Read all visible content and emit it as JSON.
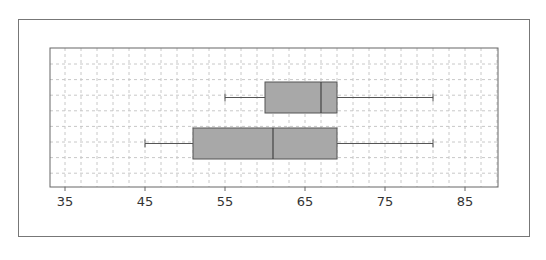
{
  "chart_data": {
    "type": "boxplot",
    "orientation": "horizontal",
    "title": "",
    "xlabel": "",
    "ylabel": "",
    "xlim": [
      34,
      89
    ],
    "x_ticks": [
      35,
      45,
      55,
      65,
      75,
      85
    ],
    "x_tick_labels": [
      "35",
      "45",
      "55",
      "65",
      "75",
      "85"
    ],
    "grid": true,
    "grid_style": "dashed",
    "legend": null,
    "series": [
      {
        "name": "top",
        "min": 55,
        "q1": 60,
        "median": 67,
        "q3": 69,
        "max": 81
      },
      {
        "name": "bottom",
        "min": 45,
        "q1": 51,
        "median": 61,
        "q3": 69,
        "max": 81
      }
    ],
    "colors": {
      "box_fill": "#a8a8a8",
      "box_stroke": "#555555",
      "grid": "#c8c8c8",
      "axis": "#666666"
    }
  }
}
